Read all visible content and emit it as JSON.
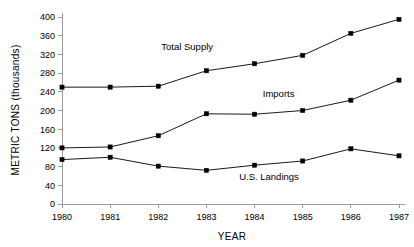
{
  "chart_data": {
    "type": "line",
    "title": "",
    "xlabel": "YEAR",
    "ylabel": "METRIC TONS (thousands)",
    "categories": [
      "1980",
      "1981",
      "1982",
      "1983",
      "1984",
      "1985",
      "1986",
      "1987"
    ],
    "x": [
      1980,
      1981,
      1982,
      1983,
      1984,
      1985,
      1986,
      1987
    ],
    "xlim": [
      1980,
      1987
    ],
    "ylim": [
      0,
      400
    ],
    "y_ticks": [
      0,
      40,
      80,
      120,
      160,
      200,
      240,
      280,
      320,
      360,
      400
    ],
    "y_tick_labels": [
      "0",
      "40",
      "80",
      "120",
      "160",
      "200",
      "240",
      "280",
      "320",
      "360",
      "400"
    ],
    "grid": false,
    "legend": "inline-annotations",
    "marker": "square",
    "line_color": "#000000",
    "series": [
      {
        "name": "Total Supply",
        "values": [
          250,
          250,
          252,
          285,
          300,
          318,
          365,
          395
        ],
        "annotation": "Total Supply"
      },
      {
        "name": "Imports",
        "values": [
          120,
          122,
          146,
          193,
          192,
          200,
          222,
          265
        ],
        "annotation": "Imports"
      },
      {
        "name": "U.S. Landings",
        "values": [
          95,
          100,
          81,
          72,
          83,
          92,
          118,
          103
        ],
        "annotation": "U.S. Landings"
      }
    ],
    "annotations": [
      {
        "text": "Total Supply",
        "x": 1982.6,
        "y": 330
      },
      {
        "text": "Imports",
        "x": 1984.5,
        "y": 228
      },
      {
        "text": "U.S. Landings",
        "x": 1984.3,
        "y": 52
      }
    ]
  }
}
